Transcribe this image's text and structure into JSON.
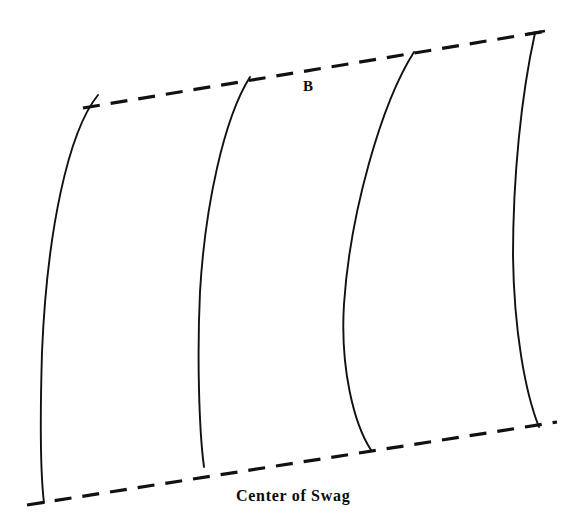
{
  "figure": {
    "title_labels": {
      "section_label": "B",
      "baseline_label": "Center of Swag"
    },
    "background_color": "#ffffff",
    "ink_color": "#111111",
    "canvas": {
      "width": 588,
      "height": 527
    },
    "guides": [
      {
        "name": "top-edge-guide",
        "style": "dashed",
        "start": {
          "x": 83,
          "y": 108
        },
        "end": {
          "x": 547,
          "y": 31
        }
      },
      {
        "name": "bottom-edge-guide",
        "style": "dashed",
        "start": {
          "x": 27,
          "y": 505
        },
        "end": {
          "x": 557,
          "y": 422
        }
      }
    ],
    "pleat_curves": [
      {
        "name": "pleat-curve-1",
        "top": {
          "x": 98,
          "y": 95
        },
        "bottom": {
          "x": 44,
          "y": 503
        },
        "bulge_x": 42,
        "bulge_y": 390
      },
      {
        "name": "pleat-curve-2",
        "top": {
          "x": 250,
          "y": 77
        },
        "bottom": {
          "x": 204,
          "y": 467
        },
        "bulge_x": 199,
        "bulge_y": 320
      },
      {
        "name": "pleat-curve-3",
        "top": {
          "x": 414,
          "y": 52
        },
        "bottom": {
          "x": 371,
          "y": 450
        },
        "bulge_x": 343,
        "bulge_y": 310
      },
      {
        "name": "pleat-curve-4",
        "top": {
          "x": 535,
          "y": 33
        },
        "bottom": {
          "x": 539,
          "y": 427
        },
        "bulge_x": 513,
        "bulge_y": 250
      }
    ]
  }
}
